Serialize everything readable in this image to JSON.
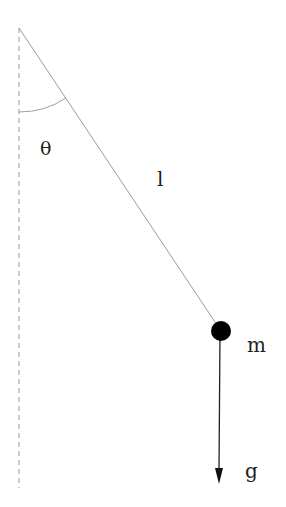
{
  "diagram": {
    "labels": {
      "angle": "θ",
      "length": "l",
      "mass": "m",
      "gravity": "g"
    },
    "geometry": {
      "pivot": [
        19,
        28
      ],
      "bob_center": [
        221,
        331
      ],
      "bob_radius": 10,
      "gravity_arrow_end": [
        219,
        484
      ],
      "vertical_reference_end": [
        19,
        488
      ]
    },
    "colors": {
      "string": "#9a9a9a",
      "reference_line": "#9a9a9a",
      "angle_arc": "#a0a0a0",
      "bob": "#000000",
      "arrow": "#222222",
      "text": "#222222"
    }
  }
}
